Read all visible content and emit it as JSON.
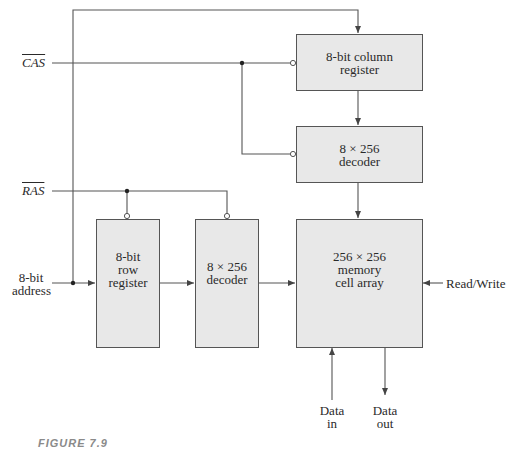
{
  "diagram": {
    "type": "block-diagram",
    "signals": {
      "cas": "CAS",
      "ras": "RAS",
      "address": [
        "8-bit",
        "address"
      ],
      "read_write": "Read/Write",
      "data_in": [
        "Data",
        "in"
      ],
      "data_out": [
        "Data",
        "out"
      ]
    },
    "blocks": {
      "column_register": [
        "8-bit column",
        "register"
      ],
      "column_decoder": [
        "8 × 256",
        "decoder"
      ],
      "row_register": [
        "8-bit",
        "row",
        "register"
      ],
      "row_decoder": [
        "8 × 256",
        "decoder"
      ],
      "memory_array": [
        "256 × 256",
        "memory",
        "cell array"
      ]
    },
    "caption": "FIGURE 7.9",
    "colors": {
      "block_fill": "#e8e8e8",
      "line": "#555555"
    }
  }
}
